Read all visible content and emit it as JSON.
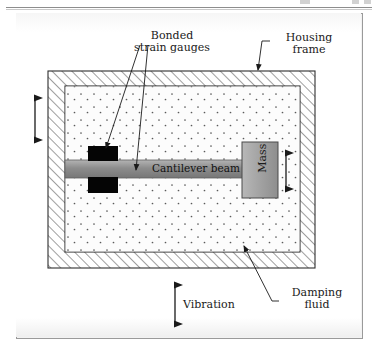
{
  "figure": {
    "labels": {
      "bonded_strain_gauges": "Bonded\nstrain gauges",
      "housing_frame": "Housing\nframe",
      "damping_fluid": "Damping\nfluid",
      "vibration": "Vibration",
      "cantilever_beam": "Cantilever beam",
      "mass": "Mass"
    },
    "parts": [
      {
        "name": "housing-frame",
        "style": "hatched",
        "label": "Housing frame"
      },
      {
        "name": "damping-fluid",
        "style": "stippled",
        "label": "Damping fluid"
      },
      {
        "name": "cantilever-beam",
        "style": "gray-bar",
        "label": "Cantilever beam"
      },
      {
        "name": "strain-gauge-upper",
        "style": "black-block",
        "label": "Bonded strain gauges"
      },
      {
        "name": "strain-gauge-lower",
        "style": "black-block",
        "label": "Bonded strain gauges"
      },
      {
        "name": "seismic-mass",
        "style": "gray-block",
        "label": "Mass"
      }
    ],
    "arrows": [
      {
        "name": "vibration-arrow-left",
        "direction": "vertical-double",
        "meaning": "Vibration"
      },
      {
        "name": "vibration-arrow-bottom",
        "direction": "vertical-double",
        "meaning": "Vibration"
      },
      {
        "name": "mass-motion-arrow",
        "direction": "vertical-double",
        "meaning": "Mass displacement"
      }
    ],
    "colors": {
      "beam": "#8f8f8f",
      "mass": "#a3a3a3",
      "gauge": "#000000",
      "ink": "#1a1a1a",
      "frame_line": "#3c3c3c",
      "card_border": "#9a9a9a"
    }
  }
}
